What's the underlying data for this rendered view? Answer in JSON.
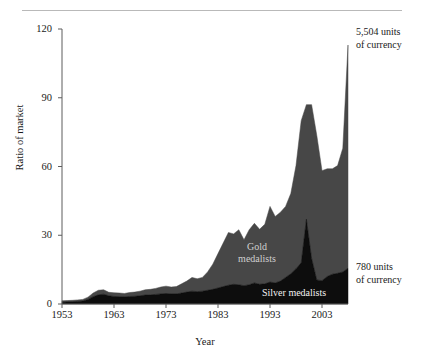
{
  "figure": {
    "cut_off_header_text": "",
    "top_rule": "horizontal-rule"
  },
  "chart_data": {
    "type": "area",
    "stacked": true,
    "title": "",
    "subtitle": "",
    "xlabel": "Year",
    "ylabel": "Ratio of market",
    "xlim": [
      1953,
      2008
    ],
    "ylim": [
      0,
      120
    ],
    "grid": false,
    "legend_position": "inline-annotations",
    "xticks": [
      1953,
      1963,
      1973,
      1983,
      1993,
      2003
    ],
    "xticklabels": [
      "1953",
      "1963",
      "1973",
      "1983",
      "1993",
      "2003"
    ],
    "yticks": [
      0,
      30,
      60,
      90,
      120
    ],
    "yticklabels": [
      "0",
      "30",
      "60",
      "90",
      "120"
    ],
    "x": [
      1953,
      1954,
      1955,
      1956,
      1957,
      1958,
      1959,
      1960,
      1961,
      1962,
      1963,
      1964,
      1965,
      1966,
      1967,
      1968,
      1969,
      1970,
      1971,
      1972,
      1973,
      1974,
      1975,
      1976,
      1977,
      1978,
      1979,
      1980,
      1981,
      1982,
      1983,
      1984,
      1985,
      1986,
      1987,
      1988,
      1989,
      1990,
      1991,
      1992,
      1993,
      1994,
      1995,
      1996,
      1997,
      1998,
      1999,
      2000,
      2001,
      2002,
      2003,
      2004,
      2005,
      2006,
      2007,
      2008
    ],
    "series": [
      {
        "name": "Silver medalists",
        "color": "#0d0d0d",
        "label_color": "#f2f2f2",
        "values": [
          0.8,
          0.9,
          1.0,
          1.1,
          1.3,
          2.0,
          3.2,
          4.0,
          4.3,
          3.6,
          3.3,
          3.2,
          3.1,
          3.3,
          3.4,
          3.6,
          3.9,
          4.0,
          4.2,
          4.4,
          4.6,
          4.4,
          4.4,
          4.8,
          5.2,
          5.6,
          5.4,
          5.6,
          6.0,
          6.4,
          7.0,
          7.6,
          8.2,
          8.6,
          8.4,
          8.0,
          8.4,
          9.2,
          8.6,
          8.8,
          9.6,
          9.2,
          10.0,
          11.6,
          13.2,
          15.4,
          18.0,
          37.0,
          20.0,
          10.5,
          10.2,
          12.0,
          13.0,
          13.4,
          14.0,
          15.6
        ]
      },
      {
        "name": "Gold medalists",
        "color": "#474747",
        "label_color": "#cfcfcf",
        "values": [
          0.6,
          0.6,
          0.6,
          0.7,
          0.7,
          1.0,
          1.6,
          2.0,
          1.9,
          1.5,
          1.6,
          1.6,
          1.5,
          1.7,
          1.8,
          2.0,
          2.3,
          2.4,
          2.6,
          3.0,
          3.2,
          3.0,
          3.2,
          4.0,
          4.8,
          6.0,
          5.6,
          6.0,
          8.0,
          11.0,
          15.0,
          19.0,
          23.0,
          22.0,
          24.0,
          20.0,
          24.0,
          26.0,
          24.0,
          26.0,
          33.0,
          29.0,
          30.0,
          31.0,
          35.0,
          45.0,
          62.0,
          50.0,
          67.0,
          63.0,
          48.0,
          47.0,
          46.0,
          47.0,
          54.0,
          97.4
        ]
      }
    ],
    "peak_total": 113,
    "annotations": [
      {
        "name": "top-value-annotation",
        "text": "5,504 units\nof currency",
        "anchor": "end-of-gold-series"
      },
      {
        "name": "bottom-value-annotation",
        "text": "780 units\nof currency",
        "anchor": "end-of-silver-series"
      }
    ],
    "inline_labels": [
      {
        "name": "gold-series-label",
        "text": "Gold\nmedalists"
      },
      {
        "name": "silver-series-label",
        "text": "Silver medalists"
      }
    ]
  }
}
